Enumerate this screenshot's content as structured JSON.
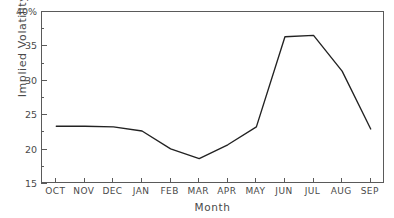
{
  "chart_data": {
    "type": "line",
    "title": "",
    "xlabel": "Month",
    "ylabel": "Implied Volatility",
    "categories": [
      "OCT",
      "NOV",
      "DEC",
      "JAN",
      "FEB",
      "MAR",
      "APR",
      "MAY",
      "JUN",
      "JUL",
      "AUG",
      "SEP"
    ],
    "values": [
      23.4,
      23.4,
      23.3,
      22.7,
      20.1,
      18.7,
      20.7,
      23.3,
      36.4,
      36.6,
      31.4,
      23.0
    ],
    "series": [
      {
        "name": "Implied Volatility",
        "values": [
          23.4,
          23.4,
          23.3,
          22.7,
          20.1,
          18.7,
          20.7,
          23.3,
          36.4,
          36.6,
          31.4,
          23.0
        ]
      }
    ],
    "ylim": [
      15,
      40
    ],
    "ytick_values": [
      15,
      20,
      25,
      30,
      35,
      40
    ],
    "ytick_labels": [
      "15",
      "20",
      "25",
      "30",
      "35",
      "40%"
    ],
    "yminor_tick_values": [
      17.5,
      22.5,
      27.5,
      32.5,
      37.5
    ],
    "grid": false,
    "legend": false,
    "legend_position": "none",
    "line_color": "#222222",
    "background_color": "#ffffff",
    "axis_color": "#5a5a5a",
    "text_color": "#4a4a4a"
  }
}
